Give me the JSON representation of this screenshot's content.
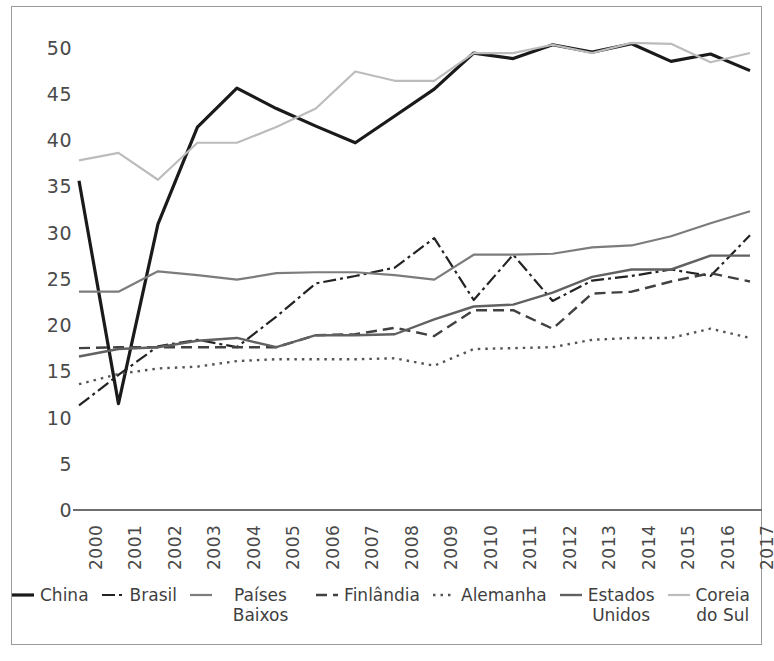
{
  "chart_data": {
    "type": "line",
    "title": "",
    "subtitle": "",
    "xlabel": "",
    "ylabel": "",
    "x": [
      2000,
      2001,
      2002,
      2003,
      2004,
      2005,
      2006,
      2007,
      2008,
      2009,
      2010,
      2011,
      2012,
      2013,
      2014,
      2015,
      2016,
      2017
    ],
    "xtick_labels": [
      "2000",
      "2001",
      "2002",
      "2003",
      "2004",
      "2005",
      "2006",
      "2007",
      "2008",
      "2009",
      "2010",
      "2011",
      "2012",
      "2013",
      "2014",
      "2015",
      "2016",
      "2017"
    ],
    "ytick_labels": [
      "0",
      "5",
      "10",
      "15",
      "20",
      "25",
      "30",
      "35",
      "40",
      "45",
      "50"
    ],
    "yticks": [
      0,
      5,
      10,
      15,
      20,
      25,
      30,
      35,
      40,
      45,
      50
    ],
    "ylim": [
      0,
      52
    ],
    "xlim": [
      2000,
      2017
    ],
    "grid": false,
    "legend_position": "bottom",
    "series": [
      {
        "name": "China",
        "color": "#1a1a1a",
        "style": "solid",
        "width": 3.2,
        "values": [
          35.6,
          11.5,
          30.9,
          41.4,
          45.6,
          43.4,
          41.5,
          39.7,
          42.6,
          45.5,
          49.4,
          48.8,
          50.3,
          49.5,
          50.4,
          48.5,
          49.3,
          47.5
        ]
      },
      {
        "name": "Brasil",
        "color": "#232323",
        "style": "dashdot",
        "width": 2.2,
        "values": [
          11.3,
          14.6,
          17.7,
          18.4,
          17.6,
          20.9,
          24.5,
          25.3,
          26.2,
          29.4,
          22.7,
          27.6,
          22.6,
          24.8,
          25.3,
          26.0,
          25.3,
          29.7
        ]
      },
      {
        "name": "Países Baixos",
        "color": "#7c7c7c",
        "style": "solid",
        "width": 2.2,
        "values": [
          23.6,
          23.6,
          25.8,
          25.4,
          24.9,
          25.6,
          25.7,
          25.7,
          25.4,
          24.9,
          27.6,
          27.6,
          27.7,
          28.4,
          28.6,
          29.6,
          31.0,
          32.3
        ]
      },
      {
        "name": "Finlândia",
        "color": "#414141",
        "style": "dashed",
        "width": 2.4,
        "values": [
          17.5,
          17.6,
          17.6,
          17.6,
          17.6,
          17.6,
          18.9,
          19.0,
          19.7,
          18.8,
          21.6,
          21.6,
          19.6,
          23.4,
          23.6,
          24.7,
          25.6,
          24.7
        ]
      },
      {
        "name": "Alemanha",
        "color": "#555555",
        "style": "dotted",
        "width": 2.4,
        "values": [
          13.6,
          14.7,
          15.3,
          15.5,
          16.1,
          16.3,
          16.3,
          16.3,
          16.4,
          15.6,
          17.4,
          17.5,
          17.6,
          18.4,
          18.6,
          18.6,
          19.6,
          18.6
        ]
      },
      {
        "name": "Estados Unidos",
        "color": "#616161",
        "style": "solid",
        "width": 2.4,
        "values": [
          16.6,
          17.4,
          17.6,
          18.3,
          18.6,
          17.6,
          18.9,
          18.9,
          19.0,
          20.6,
          22.0,
          22.2,
          23.5,
          25.2,
          26.0,
          26.0,
          27.5,
          27.5
        ]
      },
      {
        "name": "Coreia do Sul",
        "color": "#bcbcbc",
        "style": "solid",
        "width": 2.2,
        "values": [
          37.8,
          38.6,
          35.7,
          39.7,
          39.7,
          41.4,
          43.4,
          47.4,
          46.4,
          46.4,
          49.4,
          49.4,
          50.3,
          49.4,
          50.5,
          50.4,
          48.4,
          49.4
        ]
      }
    ]
  },
  "legend": {
    "items": [
      {
        "label": "China",
        "swatch": "solid-black-thick"
      },
      {
        "label": "Brasil",
        "swatch": "dashdot-dark"
      },
      {
        "label": "Países Baixos",
        "swatch": "solid-gray"
      },
      {
        "label": "Finlândia",
        "swatch": "dashed-dark"
      },
      {
        "label": "Alemanha",
        "swatch": "dotted-gray"
      },
      {
        "label": "Estados\nUnidos",
        "swatch": "solid-darkgray"
      },
      {
        "label": "Coreia\ndo Sul",
        "swatch": "solid-lightgray"
      }
    ]
  }
}
